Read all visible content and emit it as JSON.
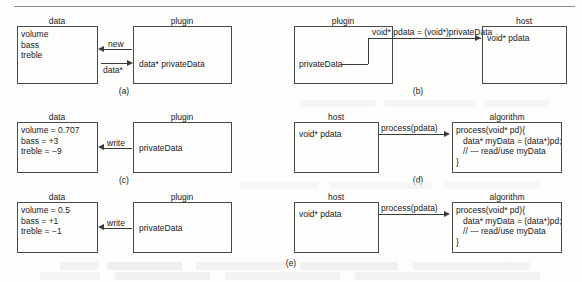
{
  "figure": {
    "type": "diagram",
    "panels": [
      {
        "id": "a",
        "label": "(a)",
        "boxes": [
          {
            "name": "data-box",
            "title": "data",
            "lines": [
              "volume",
              "bass",
              "treble"
            ]
          },
          {
            "name": "plugin-box",
            "title": "plugin",
            "lines": [
              "data* privateData"
            ]
          }
        ],
        "edges": [
          {
            "name": "new-edge",
            "label": "new",
            "direction": "left"
          },
          {
            "name": "data-ptr-edge",
            "label": "data*",
            "direction": "right"
          }
        ]
      },
      {
        "id": "b",
        "label": "(b)",
        "boxes": [
          {
            "name": "plugin-box",
            "title": "plugin",
            "lines": [
              "privateData"
            ]
          },
          {
            "name": "host-box",
            "title": "host",
            "lines": [
              "void* pdata"
            ]
          }
        ],
        "edges": [
          {
            "name": "cast-edge",
            "label": "void* pdata = (void*)privateData",
            "direction": "right"
          }
        ]
      },
      {
        "id": "c",
        "label": "(c)",
        "boxes": [
          {
            "name": "data-box",
            "title": "data",
            "lines": [
              "volume = 0.707",
              "bass = +3",
              "treble = −9"
            ]
          },
          {
            "name": "plugin-box",
            "title": "plugin",
            "lines": [
              "privateData"
            ]
          }
        ],
        "edges": [
          {
            "name": "write-edge",
            "label": "write",
            "direction": "left"
          }
        ]
      },
      {
        "id": "d",
        "label": "(d)",
        "boxes": [
          {
            "name": "host-box",
            "title": "host",
            "lines": [
              "void* pdata"
            ]
          },
          {
            "name": "algorithm-box",
            "title": "algorithm",
            "lines": [
              "process(void* pd){",
              "   data* myData = (data*)pd;",
              "   // --- read/use myData",
              "}"
            ]
          }
        ],
        "edges": [
          {
            "name": "process-edge",
            "label": "process(pdata)",
            "direction": "right"
          }
        ]
      },
      {
        "id": "e",
        "label": "(e)",
        "boxes": [
          {
            "name": "data-box",
            "title": "data",
            "lines": [
              "volume = 0.5",
              "bass = +1",
              "treble = −1"
            ]
          },
          {
            "name": "plugin-box",
            "title": "plugin",
            "lines": [
              "privateData"
            ]
          },
          {
            "name": "host-box",
            "title": "host",
            "lines": [
              "void* pdata"
            ]
          },
          {
            "name": "algorithm-box",
            "title": "algorithm",
            "lines": [
              "process(void* pd){",
              "   data* myData = (data*)pd;",
              "   // --- read/use myData",
              "}"
            ]
          }
        ],
        "edges": [
          {
            "name": "write-edge",
            "label": "write",
            "direction": "left"
          },
          {
            "name": "process-edge",
            "label": "process(pdata)",
            "direction": "right"
          }
        ]
      }
    ]
  },
  "labels": {
    "data": "data",
    "plugin": "plugin",
    "host": "host",
    "algorithm": "algorithm",
    "new": "new",
    "data_ptr": "data*",
    "write": "write",
    "process_call": "process(pdata)",
    "cast_expr": "void* pdata = (void*)privateData",
    "void_pdata": "void* pdata",
    "data_privateData": "data* privateData",
    "privateData": "privateData",
    "panel_a": "(a)",
    "panel_b": "(b)",
    "panel_c": "(c)",
    "panel_d": "(d)",
    "panel_e": "(e)"
  },
  "panel_a": {
    "data_l1": "volume",
    "data_l2": "bass",
    "data_l3": "treble"
  },
  "panel_c": {
    "data_l1": "volume = 0.707",
    "data_l2": "bass = +3",
    "data_l3": "treble = −9"
  },
  "panel_e": {
    "data_l1": "volume = 0.5",
    "data_l2": "bass = +1",
    "data_l3": "treble = −1"
  },
  "algorithm_code": {
    "l1": "process(void* pd){",
    "l2": "   data* myData = (data*)pd;",
    "l3": "   // --- read/use myData",
    "l4": "}"
  },
  "colors": {
    "ink": "#1b1b1b",
    "stroke": "#4a4a4a",
    "rule": "#8d8d8d",
    "background": "#fdfdfc"
  }
}
